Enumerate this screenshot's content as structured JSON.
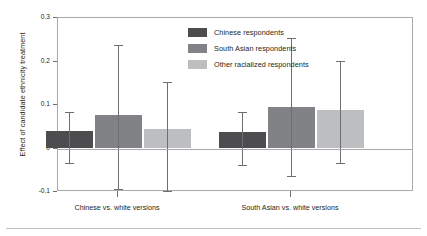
{
  "chart_data": {
    "type": "bar",
    "title": "",
    "xlabel": "",
    "ylabel": "Effect of candidate ethnicity treatment",
    "ylim": [
      -0.1,
      0.3
    ],
    "yticks": [
      -0.1,
      0,
      0.1,
      0.2,
      0.3
    ],
    "ytick_labels": [
      "-0.1",
      "0",
      "0.1",
      "0.2",
      "0.3"
    ],
    "grid": false,
    "legend_position": "top-right",
    "orientation": "vertical",
    "error_bars": true,
    "zero_reference_line": true,
    "categories": [
      "Chinese vs. white versions",
      "South Asian vs. white versions"
    ],
    "series": [
      {
        "name": "Chinese respondents",
        "color": "#4d4d4f",
        "values": [
          0.04,
          0.037
        ],
        "ci_low": [
          -0.034,
          -0.039
        ],
        "ci_high": [
          0.083,
          0.083
        ]
      },
      {
        "name": "South Asian respondents",
        "color": "#808285",
        "values": [
          0.077,
          0.095
        ],
        "ci_low": [
          -0.092,
          -0.064
        ],
        "ci_high": [
          0.237,
          0.253
        ]
      },
      {
        "name": "Other racialized respondents",
        "color": "#bcbec0",
        "values": [
          0.044,
          0.088
        ],
        "ci_low": [
          -0.097,
          -0.034
        ],
        "ci_high": [
          0.152,
          0.202
        ]
      }
    ]
  },
  "axis": {
    "y_title": "Effect of candidate ethnicity treatment",
    "y_tick_labels": [
      "0.3",
      "0.2",
      "0.1",
      "0",
      "-0.1"
    ]
  },
  "legend": {
    "items": [
      {
        "label": "Chinese respondents",
        "color": "#4d4d4f"
      },
      {
        "label": "South Asian respondents",
        "color": "#808285"
      },
      {
        "label": "Other racialized respondents",
        "color": "#bcbec0"
      }
    ]
  },
  "groups": [
    {
      "label": "Chinese vs. white versions"
    },
    {
      "label": "South Asian vs. white versions"
    }
  ]
}
